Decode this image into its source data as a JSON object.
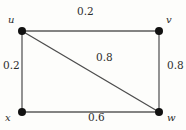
{
  "diagram": {
    "background_color": "#fdfdfb",
    "edge_color": "#555555",
    "node_color": "#111111",
    "text_color": "#2b2b2b",
    "vertices": [
      {
        "id": "u",
        "label": "u",
        "x": 22,
        "y": 31,
        "label_x": 8,
        "label_y": 15
      },
      {
        "id": "v",
        "label": "v",
        "x": 159,
        "y": 31,
        "label_x": 166,
        "label_y": 15
      },
      {
        "id": "x",
        "label": "x",
        "x": 22,
        "y": 112,
        "label_x": 5,
        "label_y": 113
      },
      {
        "id": "w",
        "label": "w",
        "x": 159,
        "y": 112,
        "label_x": 167,
        "label_y": 113
      }
    ],
    "edges": [
      {
        "from": "u",
        "to": "v",
        "weight": "0.2",
        "position": "top"
      },
      {
        "from": "u",
        "to": "x",
        "weight": "0.2",
        "position": "left"
      },
      {
        "from": "v",
        "to": "w",
        "weight": "0.8",
        "position": "right"
      },
      {
        "from": "x",
        "to": "w",
        "weight": "0.6",
        "position": "bottom"
      },
      {
        "from": "u",
        "to": "w",
        "weight": "0.8",
        "position": "diagonal"
      }
    ]
  }
}
